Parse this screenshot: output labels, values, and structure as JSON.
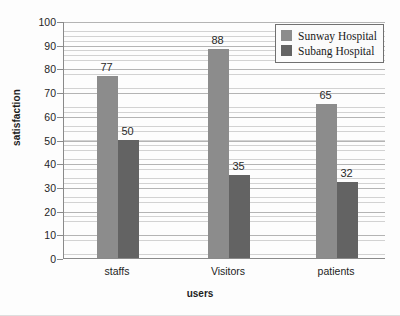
{
  "chart_data": {
    "type": "bar",
    "title": "",
    "xlabel": "users",
    "ylabel": "satisfaction",
    "categories": [
      "staffs",
      "Visitors",
      "patients"
    ],
    "series": [
      {
        "name": "Sunway Hospital",
        "color": "#8c8c8c",
        "values": [
          77,
          88,
          65
        ]
      },
      {
        "name": "Subang Hospital",
        "color": "#636363",
        "values": [
          50,
          35,
          32
        ]
      }
    ],
    "ylim": [
      0,
      100
    ],
    "ytick_step": 10,
    "yticks": [
      0,
      10,
      20,
      30,
      40,
      50,
      60,
      70,
      80,
      90,
      100
    ],
    "ytick_labels": [
      "0",
      "10",
      "20",
      "30",
      "40",
      "50",
      "60",
      "70",
      "80",
      "90",
      "100"
    ],
    "grid": true,
    "grid_orientation": "horizontal",
    "minor_gridlines": true,
    "data_labels": true,
    "legend_position": "top-right",
    "legend_entries": [
      "Sunway Hospital",
      "Subang Hospital"
    ]
  }
}
